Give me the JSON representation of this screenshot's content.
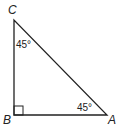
{
  "diagram": {
    "type": "right-triangle",
    "stroke_color": "#222222",
    "vertices": {
      "C": {
        "label": "C",
        "x": 14,
        "y": 20
      },
      "B": {
        "label": "B",
        "x": 14,
        "y": 115
      },
      "A": {
        "label": "A",
        "x": 107,
        "y": 115
      }
    },
    "angles": {
      "C": {
        "label": "45°"
      },
      "A": {
        "label": "45°"
      },
      "B": {
        "marker": "right-angle-square"
      }
    }
  }
}
